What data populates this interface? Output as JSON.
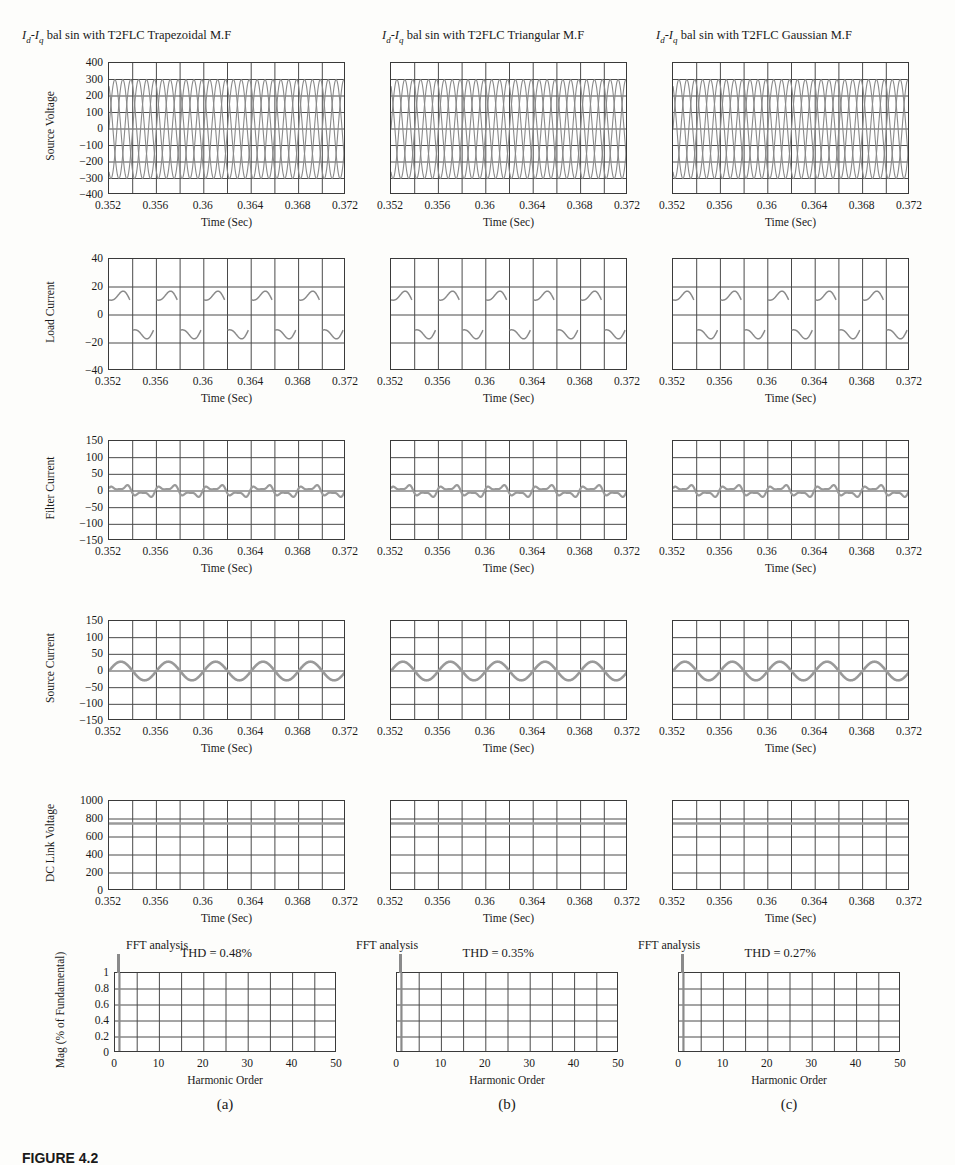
{
  "figure": {
    "caption": "FIGURE 4.2",
    "columns": [
      {
        "key": "a",
        "title_pre": "I",
        "title_sub1": "d",
        "title_mid": "-I",
        "title_sub2": "q",
        "title_post": " bal sin with T2FLC Trapezoidal M.F",
        "title_full": "Id-Iq bal sin with T2FLC Trapezoidal M.F",
        "sublabel": "(a)",
        "thd_label": "THD = 0.48%",
        "fft_note": "FFT analysis",
        "show_yticks": true
      },
      {
        "key": "b",
        "title_pre": "I",
        "title_sub1": "d",
        "title_mid": "-I",
        "title_sub2": "q",
        "title_post": " bal sin with T2FLC Triangular M.F",
        "title_full": "Id-Iq bal sin with T2FLC Triangular M.F",
        "sublabel": "(b)",
        "thd_label": "THD = 0.35%",
        "fft_note": "FFT analysis",
        "show_yticks": false
      },
      {
        "key": "c",
        "title_pre": "I",
        "title_sub1": "d",
        "title_mid": "-I",
        "title_sub2": "q",
        "title_post": " bal sin with T2FLC Gaussian M.F",
        "title_full": "Id-Iq bal sin with T2FLC Gaussian M.F",
        "sublabel": "(c)",
        "thd_label": "THD = 0.27%",
        "fft_note": "FFT analysis",
        "show_yticks": false
      }
    ],
    "time_axis": {
      "label": "Time (Sec)",
      "ticks": [
        "0.352",
        "0.356",
        "0.36",
        "0.364",
        "0.368",
        "0.372"
      ],
      "min": 0.352,
      "max": 0.372
    },
    "harmonic_axis": {
      "label": "Harmonic Order",
      "ticks": [
        "0",
        "10",
        "20",
        "30",
        "40",
        "50"
      ],
      "min": 0,
      "max": 50
    },
    "row_labels": [
      "Source Voltage",
      "Load Current",
      "Filter Current",
      "Source Current",
      "DC Link Voltage",
      "Mag (% of Fundamental)"
    ]
  },
  "chart_data": [
    {
      "type": "line",
      "id": "source-voltage",
      "title": "Source Voltage",
      "xlabel": "Time (Sec)",
      "ylabel": "Source Voltage",
      "xlim": [
        0.352,
        0.372
      ],
      "ylim": [
        -400,
        400
      ],
      "yticks": [
        400,
        300,
        200,
        100,
        0,
        -100,
        -200,
        -300,
        -400
      ],
      "xticks": [
        0.352,
        0.356,
        0.36,
        0.364,
        0.368,
        0.372
      ],
      "grid": true,
      "grid_cols": 10,
      "grid_rows": 8,
      "waveform": "three-phase-sine",
      "amplitude": 300,
      "frequency_hz": 500,
      "phases_deg": [
        0,
        120,
        240
      ],
      "series": [
        {
          "name": "Va",
          "amplitude": 300,
          "phase_deg": 0
        },
        {
          "name": "Vb",
          "amplitude": 300,
          "phase_deg": 120
        },
        {
          "name": "Vc",
          "amplitude": 300,
          "phase_deg": 240
        }
      ]
    },
    {
      "type": "line",
      "id": "load-current",
      "title": "Load Current",
      "xlabel": "Time (Sec)",
      "ylabel": "Load Current",
      "xlim": [
        0.352,
        0.372
      ],
      "ylim": [
        -40,
        40
      ],
      "yticks": [
        40,
        20,
        0,
        -20,
        -40
      ],
      "xticks": [
        0.352,
        0.356,
        0.36,
        0.364,
        0.368,
        0.372
      ],
      "grid": true,
      "grid_cols": 10,
      "grid_rows": 4,
      "waveform": "rectifier-square",
      "amplitude": 15,
      "frequency_hz": 250,
      "description": "Flat-topped alternating pulses with mid-pulse dip, nonlinear diode-rectifier load"
    },
    {
      "type": "line",
      "id": "filter-current",
      "title": "Filter Current",
      "xlabel": "Time (Sec)",
      "ylabel": "Filter Current",
      "xlim": [
        0.352,
        0.372
      ],
      "ylim": [
        -150,
        150
      ],
      "yticks": [
        150,
        100,
        50,
        0,
        -50,
        -100,
        -150
      ],
      "xticks": [
        0.352,
        0.356,
        0.36,
        0.364,
        0.368,
        0.372
      ],
      "grid": true,
      "grid_cols": 10,
      "grid_rows": 6,
      "waveform": "compensation-ripple",
      "amplitude": 20,
      "frequency_hz": 250,
      "description": "Small amplitude harmonic compensation current oscillating about zero"
    },
    {
      "type": "line",
      "id": "source-current",
      "title": "Source Current",
      "xlabel": "Time (Sec)",
      "ylabel": "Source Current",
      "xlim": [
        0.352,
        0.372
      ],
      "ylim": [
        -150,
        150
      ],
      "yticks": [
        150,
        100,
        50,
        0,
        -50,
        -100,
        -150
      ],
      "xticks": [
        0.352,
        0.356,
        0.36,
        0.364,
        0.368,
        0.372
      ],
      "grid": true,
      "grid_cols": 10,
      "grid_rows": 6,
      "waveform": "sine",
      "amplitude": 28,
      "frequency_hz": 250,
      "description": "Near-sinusoidal compensated source current"
    },
    {
      "type": "line",
      "id": "dc-link-voltage",
      "title": "DC Link Voltage",
      "xlabel": "Time (Sec)",
      "ylabel": "DC Link Voltage",
      "xlim": [
        0.352,
        0.372
      ],
      "ylim": [
        0,
        1000
      ],
      "yticks": [
        1000,
        800,
        600,
        400,
        200,
        0
      ],
      "xticks": [
        0.352,
        0.356,
        0.36,
        0.364,
        0.368,
        0.372
      ],
      "grid": true,
      "grid_cols": 10,
      "grid_rows": 5,
      "waveform": "constant",
      "value": 750,
      "description": "Regulated DC link voltage held flat at approximately 750 V"
    },
    {
      "type": "bar",
      "id": "fft-analysis",
      "title": "FFT analysis",
      "xlabel": "Harmonic Order",
      "ylabel": "Mag (% of Fundamental)",
      "xlim": [
        0,
        50
      ],
      "ylim": [
        0,
        1
      ],
      "yticks": [
        1,
        0.8,
        0.6,
        0.4,
        0.2,
        0
      ],
      "xticks": [
        0,
        10,
        20,
        30,
        40,
        50
      ],
      "grid": true,
      "grid_cols": 10,
      "grid_rows": 5,
      "categories": [
        1
      ],
      "values": [
        1.0
      ],
      "description": "Single fundamental spike at harmonic order 1 with magnitude 1.0; all higher harmonics negligible"
    }
  ]
}
